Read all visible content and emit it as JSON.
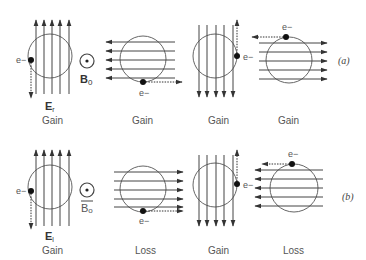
{
  "diagram": {
    "colors": {
      "line": "#555555",
      "arrow": "#333333",
      "electron": "#111111",
      "text": "#555555"
    },
    "rows": [
      {
        "label": "(a)",
        "field_label_E": "E",
        "field_label_E_sub": "r",
        "field_label_B": "B",
        "field_label_B_sub": "0",
        "electron": "e−",
        "panels": [
          {
            "field_direction": "up",
            "electron_position": "left",
            "velocity": "down",
            "result": "Gain"
          },
          {
            "field_direction": "left",
            "electron_position": "bottom",
            "velocity": "right",
            "result": "Gain"
          },
          {
            "field_direction": "down",
            "electron_position": "right",
            "velocity": "up",
            "result": "Gain"
          },
          {
            "field_direction": "right",
            "electron_position": "top",
            "velocity": "left",
            "result": "Gain"
          }
        ]
      },
      {
        "label": "(b)",
        "field_label_E": "E",
        "field_label_E_sub": "l",
        "field_label_B": "B",
        "field_label_B_sub": "o",
        "electron": "e−",
        "panels": [
          {
            "field_direction": "up",
            "electron_position": "left",
            "velocity": "down",
            "result": "Gain"
          },
          {
            "field_direction": "right",
            "electron_position": "bottom",
            "velocity": "right",
            "result": "Loss"
          },
          {
            "field_direction": "down",
            "electron_position": "right",
            "velocity": "up",
            "result": "Gain"
          },
          {
            "field_direction": "left",
            "electron_position": "top",
            "velocity": "left",
            "result": "Loss"
          }
        ]
      }
    ]
  }
}
